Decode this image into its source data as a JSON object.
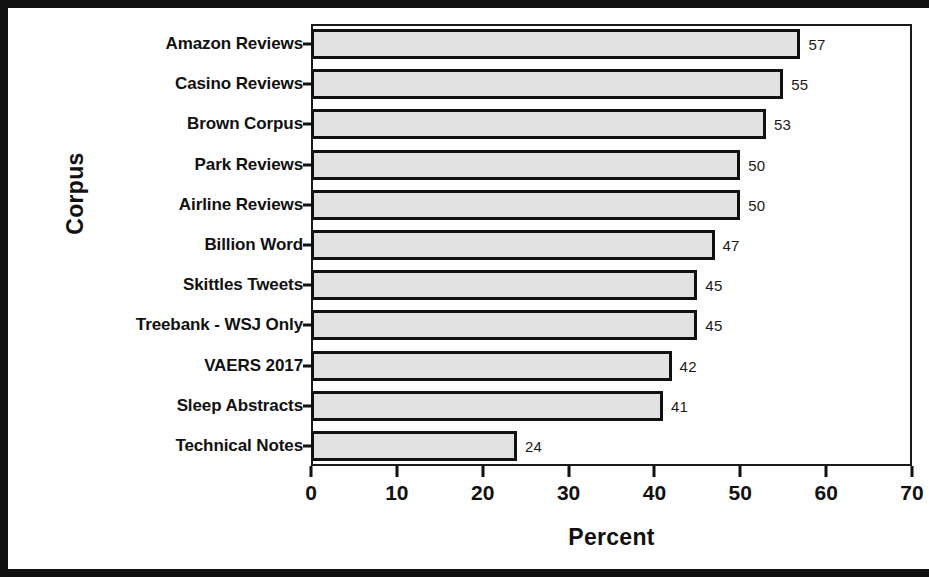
{
  "chart_data": {
    "type": "bar",
    "orientation": "horizontal",
    "title": "",
    "xlabel": "Percent",
    "ylabel": "Corpus",
    "xlim": [
      0,
      70
    ],
    "xticks": [
      0,
      10,
      20,
      30,
      40,
      50,
      60,
      70
    ],
    "grid": false,
    "legend": null,
    "bar_fill_color": "#e2e2e2",
    "bar_edge_color": "#111111",
    "categories": [
      "Amazon Reviews",
      "Casino Reviews",
      "Brown Corpus",
      "Park Reviews",
      "Airline Reviews",
      "Billion Word",
      "Skittles Tweets",
      "Treebank - WSJ Only",
      "VAERS 2017",
      "Sleep Abstracts",
      "Technical Notes"
    ],
    "values": [
      57,
      55,
      53,
      50,
      50,
      47,
      45,
      45,
      42,
      41,
      24
    ],
    "value_labels": [
      "57",
      "55",
      "53",
      "50",
      "50",
      "47",
      "45",
      "45",
      "42",
      "41",
      "24"
    ],
    "xtick_labels": [
      "0",
      "10",
      "20",
      "30",
      "40",
      "50",
      "60",
      "70"
    ]
  }
}
